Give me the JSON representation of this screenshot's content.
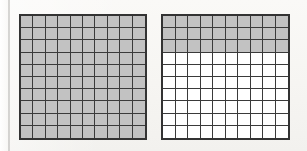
{
  "figure": {
    "background_color": "#f7f6f4",
    "shaded_color": "#c2c2c2",
    "gridline_color": "#3a3a3a",
    "border_color": "#333333",
    "unshaded_color": "#ffffff"
  },
  "chart_data": {
    "type": "table",
    "subtitle": "",
    "xlabel": "",
    "ylabel": "",
    "grid": true,
    "legend_position": "none",
    "annotations": [],
    "grids": [
      {
        "name": "left-grid",
        "rows": 10,
        "columns": 10,
        "total_cells": 100,
        "shaded_cells": 100,
        "unshaded_cells": 0,
        "shaded_rows": 10,
        "fraction": "100/100",
        "decimal": 1.0,
        "percent": 100,
        "row_shading": [
          true,
          true,
          true,
          true,
          true,
          true,
          true,
          true,
          true,
          true
        ]
      },
      {
        "name": "right-grid",
        "rows": 10,
        "columns": 10,
        "total_cells": 100,
        "shaded_cells": 30,
        "unshaded_cells": 70,
        "shaded_rows": 3,
        "fraction": "30/100",
        "decimal": 0.3,
        "percent": 30,
        "row_shading": [
          true,
          true,
          true,
          false,
          false,
          false,
          false,
          false,
          false,
          false
        ]
      }
    ],
    "categories": [
      "left-grid",
      "right-grid"
    ],
    "values": [
      100,
      30
    ],
    "ylim": [
      0,
      100
    ]
  }
}
